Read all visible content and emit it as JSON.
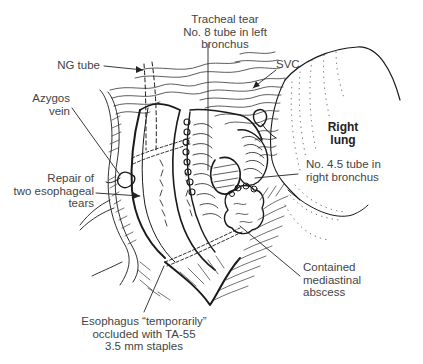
{
  "figure": {
    "type": "surgical illustration",
    "labels": {
      "tracheal_tear": [
        "Tracheal tear",
        "No. 8 tube in left",
        "bronchus"
      ],
      "ng_tube": [
        "NG tube"
      ],
      "svc": [
        "SVC"
      ],
      "azygos_vein": [
        "Azygos",
        "vein"
      ],
      "right_lung": [
        "Right",
        "lung"
      ],
      "right_bronchus_tube": [
        "No. 4.5 tube in",
        "right bronchus"
      ],
      "esophageal_repair": [
        "Repair of",
        "two esophageal",
        "tears"
      ],
      "abscess": [
        "Contained",
        "mediastinal",
        "abscess"
      ],
      "esophagus_occluded": [
        "Esophagus “temporarily”",
        "occluded with TA-55",
        "3.5 mm staples"
      ]
    },
    "colors": {
      "ink": "#1a1a1a",
      "label_text": "#444444",
      "background": "#ffffff"
    }
  }
}
